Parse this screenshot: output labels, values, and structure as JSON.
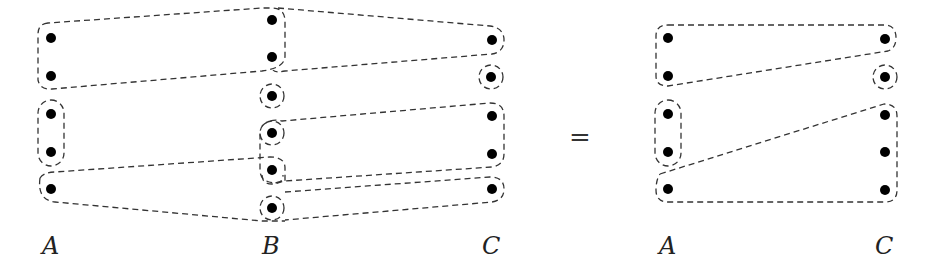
{
  "left": {
    "labels": {
      "A": "A",
      "B": "B",
      "C": "C"
    },
    "A_points": 5,
    "B_points": 6,
    "C_points": 5
  },
  "equals": "=",
  "right": {
    "labels": {
      "A": "A",
      "C": "C"
    },
    "A_points": 5,
    "C_points": 5
  },
  "colors": {
    "dot": "#000000",
    "dashed_outline": "#333333"
  }
}
